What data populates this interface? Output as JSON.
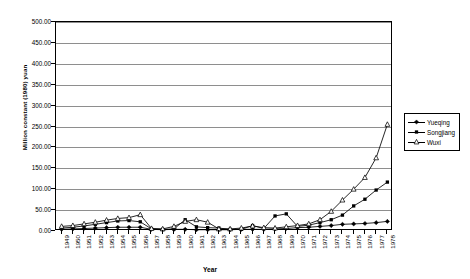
{
  "chart_data": {
    "type": "line",
    "title": "",
    "xlabel": "Year",
    "ylabel": "Million constant (1980) yuan",
    "ylim": [
      0,
      500
    ],
    "ytick_step": 50,
    "ytick_labels": [
      "0.00",
      "50.00",
      "100.00",
      "150.00",
      "200.00",
      "250.00",
      "300.00",
      "350.00",
      "400.00",
      "450.00",
      "500.00"
    ],
    "grid": true,
    "legend_position": "right",
    "x": [
      1949,
      1950,
      1951,
      1952,
      1953,
      1954,
      1955,
      1956,
      1957,
      1958,
      1959,
      1960,
      1961,
      1962,
      1963,
      1964,
      1965,
      1966,
      1967,
      1968,
      1969,
      1970,
      1971,
      1972,
      1973,
      1974,
      1975,
      1976,
      1977,
      1978
    ],
    "categories": [
      "1949",
      "1950",
      "1951",
      "1952",
      "1953",
      "1954",
      "1955",
      "1956",
      "1957",
      "1958",
      "1959",
      "1960",
      "1961",
      "1962",
      "1963",
      "1964",
      "1965",
      "1966",
      "1967",
      "1968",
      "1969",
      "1970",
      "1971",
      "1972",
      "1973",
      "1974",
      "1975",
      "1976",
      "1977",
      "1978"
    ],
    "series": [
      {
        "name": "Yueqing",
        "marker": "filled-diamond",
        "values": [
          4,
          5,
          6,
          7,
          8,
          9,
          9,
          9,
          4,
          3,
          4,
          4,
          3,
          3,
          3,
          3,
          4,
          4,
          4,
          5,
          6,
          8,
          9,
          11,
          13,
          16,
          17,
          18,
          20,
          23
        ]
      },
      {
        "name": "Songjiang",
        "marker": "filled-square",
        "values": [
          7,
          9,
          12,
          16,
          20,
          24,
          25,
          22,
          5,
          4,
          5,
          27,
          10,
          8,
          7,
          4,
          4,
          13,
          6,
          36,
          41,
          11,
          14,
          20,
          27,
          38,
          60,
          76,
          98,
          117
        ]
      },
      {
        "name": "Wuxi",
        "marker": "open-triangle",
        "values": [
          11,
          13,
          17,
          21,
          26,
          30,
          32,
          39,
          6,
          5,
          11,
          23,
          27,
          21,
          5,
          5,
          7,
          12,
          8,
          7,
          10,
          13,
          17,
          27,
          47,
          74,
          100,
          128,
          175,
          255
        ]
      }
    ],
    "annotations": {
      "wuxi_full_values": [
        11,
        13,
        17,
        21,
        26,
        30,
        32,
        39,
        6,
        5,
        11,
        23,
        27,
        21,
        5,
        5,
        7,
        12,
        8,
        7,
        10,
        13,
        17,
        27,
        47,
        74,
        100,
        128,
        175,
        255
      ]
    }
  },
  "chart_data_actual": {
    "note": "rendered series",
    "yueqing": [
      4,
      5,
      6,
      7,
      8,
      9,
      9,
      9,
      4,
      3,
      4,
      4,
      3,
      3,
      3,
      3,
      4,
      4,
      4,
      5,
      6,
      8,
      9,
      11,
      13,
      16,
      17,
      18,
      20,
      23
    ],
    "songjiang": [
      7,
      9,
      12,
      16,
      20,
      24,
      25,
      22,
      5,
      4,
      5,
      27,
      10,
      8,
      7,
      4,
      4,
      13,
      6,
      36,
      41,
      11,
      14,
      20,
      27,
      38,
      60,
      76,
      98,
      117
    ],
    "wuxi": [
      11,
      13,
      17,
      21,
      26,
      30,
      32,
      39,
      6,
      5,
      11,
      23,
      27,
      21,
      5,
      5,
      7,
      12,
      8,
      7,
      10,
      13,
      17,
      27,
      47,
      74,
      100,
      128,
      175,
      255
    ]
  },
  "legend": {
    "items": [
      {
        "label": "Yueqing",
        "marker": "filled-diamond"
      },
      {
        "label": "Songjiang",
        "marker": "filled-square"
      },
      {
        "label": "Wuxi",
        "marker": "open-triangle"
      }
    ]
  },
  "axis": {
    "x_title": "Year",
    "y_title": "Million constant (1980) yuan"
  },
  "colors": {
    "line": "#000000",
    "grid": "#8e8e8e",
    "frame": "#000000",
    "background": "#ffffff"
  }
}
